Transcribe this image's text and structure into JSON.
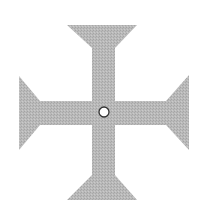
{
  "figure": {
    "subject": "cross-pattee",
    "colors": {
      "background": "#ffffff",
      "cross_fill": "#b9b9b9",
      "cross_texture": "#a6a6a6",
      "center_fill": "#ffffff",
      "center_stroke": "#333333"
    },
    "cross": {
      "center": [
        104,
        112
      ],
      "top_arm": {
        "outer_edge_y": 25,
        "outer_x": [
          67,
          137
        ],
        "neck_y": 48
      },
      "bottom_arm": {
        "outer_edge_y": 200,
        "outer_x": [
          67,
          137
        ],
        "neck_y": 175
      },
      "left_arm": {
        "outer_edge_x": 19,
        "outer_y": [
          76,
          150
        ],
        "neck_x": 40
      },
      "right_arm": {
        "outer_edge_x": 189,
        "outer_y": [
          75,
          150
        ],
        "neck_x": 166
      },
      "vertical_bar_x": [
        92,
        115
      ],
      "horizontal_bar_y": [
        101,
        125
      ]
    },
    "center_circle": {
      "cx": 104,
      "cy": 112,
      "r": 5
    }
  }
}
